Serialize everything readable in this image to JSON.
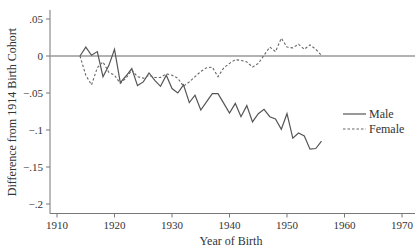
{
  "chart_data": {
    "type": "line",
    "title": "",
    "xlabel": "Year of Birth",
    "ylabel": "Difference from 1914 Birth Cohort",
    "xlim": [
      1908.8,
      1971.5
    ],
    "ylim": [
      -0.213,
      0.075
    ],
    "x_ticks": [
      1910,
      1920,
      1930,
      1940,
      1950,
      1960,
      1970
    ],
    "x_tick_labels": [
      "1910",
      "1920",
      "1930",
      "1940",
      "1950",
      "1960",
      "1970"
    ],
    "y_ticks": [
      0.05,
      0,
      -0.05,
      -0.1,
      -0.15,
      -0.2
    ],
    "y_tick_labels": [
      ".05",
      "0",
      "-.05",
      "-.1",
      "-.15",
      "-.2"
    ],
    "reference_line": {
      "y": 0,
      "color": "#999999"
    },
    "grid": false,
    "legend_position": "right-middle",
    "x": [
      1914,
      1915,
      1916,
      1917,
      1918,
      1919,
      1920,
      1921,
      1922,
      1923,
      1924,
      1925,
      1926,
      1927,
      1928,
      1929,
      1930,
      1931,
      1932,
      1933,
      1934,
      1935,
      1936,
      1937,
      1938,
      1939,
      1940,
      1941,
      1942,
      1943,
      1944,
      1945,
      1946,
      1947,
      1948,
      1949,
      1950,
      1951,
      1952,
      1953,
      1954,
      1955,
      1956
    ],
    "series": [
      {
        "name": "Male",
        "style": "solid",
        "color": "#555555",
        "values": [
          0,
          0.012,
          0.001,
          0.006,
          -0.028,
          -0.013,
          0.009,
          -0.036,
          -0.027,
          -0.017,
          -0.04,
          -0.035,
          -0.023,
          -0.033,
          -0.041,
          -0.026,
          -0.044,
          -0.05,
          -0.039,
          -0.063,
          -0.053,
          -0.073,
          -0.062,
          -0.051,
          -0.051,
          -0.064,
          -0.077,
          -0.064,
          -0.082,
          -0.067,
          -0.089,
          -0.078,
          -0.072,
          -0.082,
          -0.085,
          -0.099,
          -0.078,
          -0.111,
          -0.104,
          -0.108,
          -0.126,
          -0.125,
          -0.115
        ]
      },
      {
        "name": "Female",
        "style": "dashed",
        "color": "#666666",
        "values": [
          0,
          -0.026,
          -0.039,
          -0.016,
          -0.008,
          -0.022,
          -0.026,
          -0.037,
          -0.03,
          -0.019,
          -0.028,
          -0.03,
          -0.026,
          -0.029,
          -0.029,
          -0.024,
          -0.026,
          -0.03,
          -0.041,
          -0.035,
          -0.028,
          -0.021,
          -0.016,
          -0.015,
          -0.028,
          -0.016,
          -0.01,
          -0.005,
          -0.006,
          -0.008,
          -0.015,
          -0.01,
          0.001,
          0.012,
          0.006,
          0.024,
          0.012,
          0.011,
          0.016,
          0.009,
          0.015,
          0.009,
          0.001
        ]
      }
    ]
  },
  "legend": {
    "male_label": "Male",
    "female_label": "Female"
  },
  "axes": {
    "x_title": "Year of Birth",
    "y_title": "Difference from 1914 Birth Cohort"
  }
}
